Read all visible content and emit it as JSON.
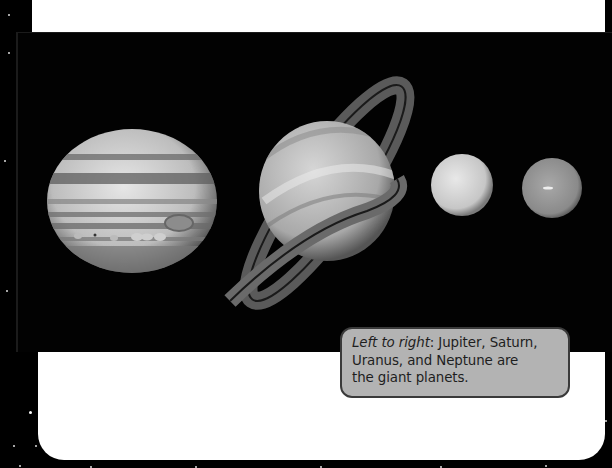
{
  "figure": {
    "planets": [
      {
        "name": "Jupiter",
        "icon": "jupiter-planet-icon"
      },
      {
        "name": "Saturn",
        "icon": "saturn-planet-icon"
      },
      {
        "name": "Uranus",
        "icon": "uranus-planet-icon"
      },
      {
        "name": "Neptune",
        "icon": "neptune-planet-icon"
      }
    ]
  },
  "caption": {
    "lead": "Left to right",
    "line1_rest": ": Jupiter, Saturn,",
    "line2": "Uranus, and Neptune are",
    "line3": "the giant planets."
  },
  "colors": {
    "background": "#000000",
    "card": "#ffffff",
    "caption_fill": "#b3b3b3",
    "caption_border": "#3a3a3a"
  }
}
